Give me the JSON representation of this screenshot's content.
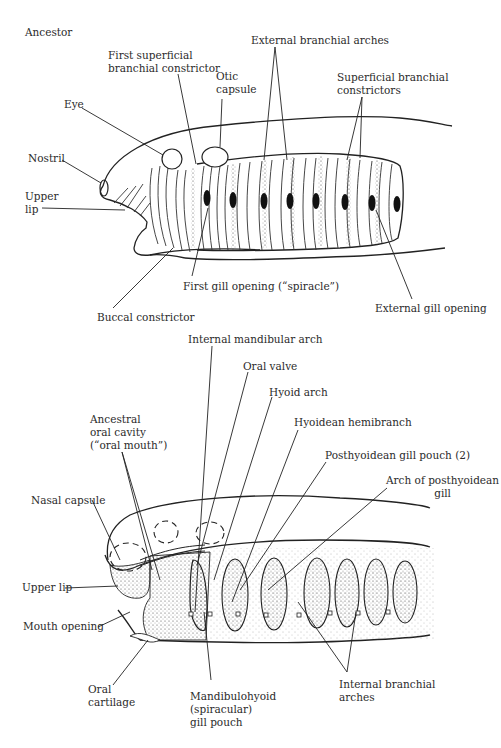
{
  "figure": {
    "top_panel": {
      "title": "Ancestor",
      "labels": {
        "first_superficial_1": "First superficial",
        "first_superficial_2": "branchial constrictor",
        "external_branchial_arches": "External branchial arches",
        "otic_1": "Otic",
        "otic_2": "capsule",
        "superficial_constrictors_1": "Superficial branchial",
        "superficial_constrictors_2": "constrictors",
        "eye": "Eye",
        "nostril": "Nostril",
        "upper_lip_1": "Upper",
        "upper_lip_2": "lip",
        "first_gill_opening": "First gill opening (“spiracle”)",
        "buccal_constrictor": "Buccal constrictor",
        "external_gill_opening": "External gill opening"
      }
    },
    "bottom_panel": {
      "labels": {
        "internal_mandibular_arch": "Internal mandibular arch",
        "oral_valve": "Oral valve",
        "hyoid_arch": "Hyoid arch",
        "hyoidean_hemibranch": "Hyoidean hemibranch",
        "posthyoidean_gill_pouch": "Posthyoidean gill pouch (2)",
        "arch_posthyoidean_1": "Arch of posthyoidean",
        "arch_posthyoidean_2": "gill",
        "ancestral_oral_1": "Ancestral",
        "ancestral_oral_2": "oral cavity",
        "ancestral_oral_3": "(“oral mouth”)",
        "nasal_capsule": "Nasal capsule",
        "upper_lip": "Upper lip",
        "mouth_opening": "Mouth opening",
        "oral_cartilage_1": "Oral",
        "oral_cartilage_2": "cartilage",
        "mandibulohyoid_1": "Mandibulohyoid",
        "mandibulohyoid_2": "(spiracular)",
        "mandibulohyoid_3": "gill pouch",
        "internal_branchial_1": "Internal branchial",
        "internal_branchial_2": "arches"
      }
    }
  }
}
